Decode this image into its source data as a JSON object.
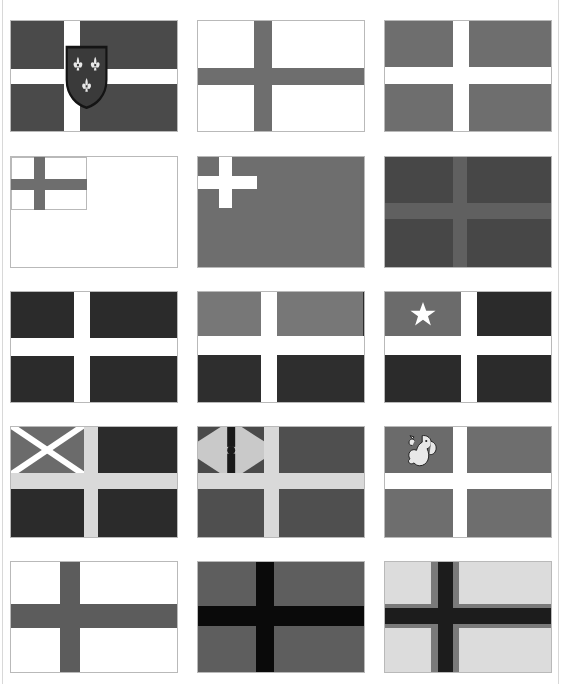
{
  "page": {
    "background": "#ffffff",
    "width": 561,
    "height": 684,
    "columns": 3,
    "rows": 5,
    "total_flags": 15
  },
  "palette": {
    "white": "#ffffff",
    "off_white": "#f6f6f6",
    "light_gray": "#d9d9d9",
    "pale_gray": "#e3e3e3",
    "mid_gray": "#8b8b8b",
    "gray": "#6e6e6e",
    "slate_gray": "#606060",
    "dark_gray": "#4a4a4a",
    "charcoal": "#3a3a3a",
    "near_black": "#2b2b2b",
    "black": "#0a0a0a",
    "border": "#b9b9b9"
  },
  "flags": [
    {
      "id": "flag-1",
      "row": 1,
      "col": 1,
      "name": "nordic-cross-with-fleur-de-lis-shield",
      "description": "Dark gray field with offset white cross and a central shield charged with three fleurs-de-lis",
      "field_color": "#4a4a4a",
      "cross_color": "#ffffff",
      "cross_style": "offset-nordic",
      "cross_vertical_x_pct": 32,
      "cross_vertical_w_pct": 10,
      "cross_horizontal_y_pct": 44,
      "cross_horizontal_h_pct": 13,
      "emblem": "shield-three-fleurs-de-lis",
      "emblem_colors": {
        "shield": "#3a3a3a",
        "charge": "#e8e8e8",
        "outline": "#141414"
      }
    },
    {
      "id": "flag-2",
      "row": 1,
      "col": 2,
      "name": "white-field-gray-cross",
      "description": "White field with a gray offset cross",
      "field_color": "#ffffff",
      "cross_color": "#6e6e6e",
      "cross_style": "offset-nordic",
      "cross_vertical_x_pct": 34,
      "cross_vertical_w_pct": 11,
      "cross_horizontal_y_pct": 43,
      "cross_horizontal_h_pct": 15,
      "emblem": "none",
      "emblem_colors": {}
    },
    {
      "id": "flag-3",
      "row": 1,
      "col": 3,
      "name": "gray-field-white-cross",
      "description": "Medium gray field with a white offset cross",
      "field_color": "#6e6e6e",
      "cross_color": "#ffffff",
      "cross_style": "offset-nordic",
      "cross_vertical_x_pct": 41,
      "cross_vertical_w_pct": 10,
      "cross_horizontal_y_pct": 42,
      "cross_horizontal_h_pct": 15,
      "emblem": "none",
      "emblem_colors": {}
    },
    {
      "id": "flag-4",
      "row": 2,
      "col": 1,
      "name": "white-ensign-with-gray-canton-cross",
      "description": "Plain white field with a gray cross confined to the upper hoist canton",
      "field_color": "#ffffff",
      "cross_color": "#6e6e6e",
      "cross_style": "canton-cross",
      "canton_w_pct": 46,
      "canton_h_pct": 48,
      "canton_color": "#ffffff",
      "cross_vertical_x_pct": 14,
      "cross_vertical_w_pct": 7,
      "cross_horizontal_y_pct": 20,
      "cross_horizontal_h_pct": 10,
      "emblem": "none",
      "emblem_colors": {}
    },
    {
      "id": "flag-5",
      "row": 2,
      "col": 2,
      "name": "gray-field-white-canton-cross",
      "description": "Solid gray field with a small white cross in the upper hoist canton",
      "field_color": "#6e6e6e",
      "cross_color": "#ffffff",
      "cross_style": "canton-cross",
      "canton_w_pct": 36,
      "canton_h_pct": 46,
      "canton_color": "#6e6e6e",
      "cross_vertical_x_pct": 13,
      "cross_vertical_w_pct": 8,
      "cross_horizontal_y_pct": 17,
      "cross_horizontal_h_pct": 12,
      "emblem": "none",
      "emblem_colors": {}
    },
    {
      "id": "flag-6",
      "row": 2,
      "col": 3,
      "name": "dark-gray-field-light-gray-cross",
      "description": "Dark gray field with a lighter gray offset cross, low contrast",
      "field_color": "#474747",
      "cross_color": "#606060",
      "cross_style": "offset-nordic",
      "cross_vertical_x_pct": 41,
      "cross_vertical_w_pct": 9,
      "cross_horizontal_y_pct": 42,
      "cross_horizontal_h_pct": 14,
      "emblem": "none",
      "emblem_colors": {}
    },
    {
      "id": "flag-7",
      "row": 3,
      "col": 1,
      "name": "charcoal-field-white-cross",
      "description": "Near-black charcoal field with a white offset cross",
      "field_color": "#2b2b2b",
      "cross_color": "#ffffff",
      "cross_style": "offset-nordic",
      "cross_vertical_x_pct": 38,
      "cross_vertical_w_pct": 10,
      "cross_horizontal_y_pct": 42,
      "cross_horizontal_h_pct": 16,
      "emblem": "none",
      "emblem_colors": {}
    },
    {
      "id": "flag-8",
      "row": 3,
      "col": 2,
      "name": "bicolor-quadrants-white-cross",
      "description": "White offset cross dividing the field into two light gray upper quadrants and two dark lower quadrants",
      "field_color": "#2b2b2b",
      "cross_color": "#ffffff",
      "cross_style": "offset-nordic-bicolor",
      "upper_quadrant_color": "#777777",
      "lower_quadrant_color": "#2e2e2e",
      "cross_vertical_x_pct": 38,
      "cross_vertical_w_pct": 10,
      "cross_horizontal_y_pct": 40,
      "cross_horizontal_h_pct": 17,
      "emblem": "none",
      "emblem_colors": {}
    },
    {
      "id": "flag-9",
      "row": 3,
      "col": 3,
      "name": "white-cross-with-star-in-canton",
      "description": "White offset cross with a light gray upper hoist canton bearing a white five-pointed star; remaining quadrants dark",
      "field_color": "#2b2b2b",
      "cross_color": "#ffffff",
      "cross_style": "offset-nordic-canton-star",
      "canton_color": "#6b6b6b",
      "cross_vertical_x_pct": 46,
      "cross_vertical_w_pct": 10,
      "cross_horizontal_y_pct": 40,
      "cross_horizontal_h_pct": 17,
      "emblem": "five-pointed-star",
      "emblem_colors": {
        "star": "#ffffff"
      }
    },
    {
      "id": "flag-10",
      "row": 4,
      "col": 1,
      "name": "white-cross-with-saltire-canton",
      "description": "Light gray offset cross; upper hoist canton is mid gray charged with a white saltire, other quadrants near-black",
      "field_color": "#2b2b2b",
      "cross_color": "#d9d9d9",
      "cross_style": "offset-nordic-canton-saltire",
      "canton_color": "#6b6b6b",
      "cross_vertical_x_pct": 44,
      "cross_vertical_w_pct": 9,
      "cross_horizontal_y_pct": 42,
      "cross_horizontal_h_pct": 14,
      "emblem": "white-saltire",
      "emblem_colors": {
        "saltire": "#ffffff"
      }
    },
    {
      "id": "flag-11",
      "row": 4,
      "col": 2,
      "name": "white-cross-with-union-canton",
      "description": "Light gray offset cross; upper hoist canton carries a union-jack style device of a black pale and dark diagonals",
      "field_color": "#4f4f4f",
      "cross_color": "#d9d9d9",
      "cross_style": "offset-nordic-canton-union",
      "canton_color": "#b9b9b9",
      "cross_vertical_x_pct": 40,
      "cross_vertical_w_pct": 9,
      "cross_horizontal_y_pct": 42,
      "cross_horizontal_h_pct": 14,
      "emblem": "union-jack-device",
      "emblem_colors": {
        "pale": "#1a1a1a",
        "diagonals": "#4a4a4a",
        "ground": "#c9c9c9"
      }
    },
    {
      "id": "flag-12",
      "row": 4,
      "col": 3,
      "name": "white-cross-with-lion-canton",
      "description": "Gray field with white offset cross; upper hoist canton bears a rampant lion emblem",
      "field_color": "#6e6e6e",
      "cross_color": "#ffffff",
      "cross_style": "offset-nordic-canton-emblem",
      "canton_color": "#6b6b6b",
      "cross_vertical_x_pct": 41,
      "cross_vertical_w_pct": 9,
      "cross_horizontal_y_pct": 42,
      "cross_horizontal_h_pct": 14,
      "emblem": "rampant-lion",
      "emblem_colors": {
        "lion": "#e8e8e8",
        "outline": "#1f1f1f"
      }
    },
    {
      "id": "flag-13",
      "row": 5,
      "col": 1,
      "name": "white-field-gray-centered-cross",
      "description": "White field with a broad gray cross, vertical arm slightly toward the hoist",
      "field_color": "#ffffff",
      "cross_color": "#5c5c5c",
      "cross_style": "offset-nordic",
      "cross_vertical_x_pct": 30,
      "cross_vertical_w_pct": 12,
      "cross_horizontal_y_pct": 38,
      "cross_horizontal_h_pct": 22,
      "emblem": "none",
      "emblem_colors": {}
    },
    {
      "id": "flag-14",
      "row": 5,
      "col": 2,
      "name": "gray-field-black-cross",
      "description": "Gray field with a bold black cross, vertical arm slightly toward the hoist",
      "field_color": "#5e5e5e",
      "cross_color": "#0a0a0a",
      "cross_style": "offset-nordic",
      "cross_vertical_x_pct": 35,
      "cross_vertical_w_pct": 11,
      "cross_horizontal_y_pct": 40,
      "cross_horizontal_h_pct": 18,
      "emblem": "none",
      "emblem_colors": {}
    },
    {
      "id": "flag-15",
      "row": 5,
      "col": 3,
      "name": "light-field-black-cross-gray-fimbriation",
      "description": "Light gray field with a black cross fimbriated in medium gray, vertical arm toward the hoist",
      "field_color": "#dcdcdc",
      "cross_color": "#1c1c1c",
      "fimbriation_color": "#7a7a7a",
      "cross_style": "offset-nordic-fimbriated",
      "cross_vertical_x_pct": 32,
      "cross_vertical_w_pct": 9,
      "cross_horizontal_y_pct": 42,
      "cross_horizontal_h_pct": 14,
      "fimbriation_pct": 4,
      "emblem": "none",
      "emblem_colors": {}
    }
  ]
}
